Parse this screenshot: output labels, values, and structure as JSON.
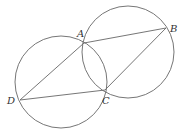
{
  "diagram": {
    "stroke_color": "#666666",
    "circles": [
      {
        "name": "left-circle",
        "cx": 61,
        "cy": 82,
        "r": 46
      },
      {
        "name": "right-circle",
        "cx": 128,
        "cy": 52,
        "r": 46
      }
    ],
    "points": {
      "A": {
        "x": 84,
        "y": 43,
        "label": "A",
        "lx": 77,
        "ly": 37
      },
      "B": {
        "x": 166,
        "y": 28,
        "label": "B",
        "lx": 170,
        "ly": 32
      },
      "C": {
        "x": 105,
        "y": 90,
        "label": "C",
        "lx": 102,
        "ly": 104
      },
      "D": {
        "x": 20,
        "y": 100,
        "label": "D",
        "lx": 7,
        "ly": 104
      }
    },
    "segments": [
      [
        "A",
        "B"
      ],
      [
        "B",
        "C"
      ],
      [
        "C",
        "D"
      ],
      [
        "D",
        "A"
      ]
    ]
  }
}
